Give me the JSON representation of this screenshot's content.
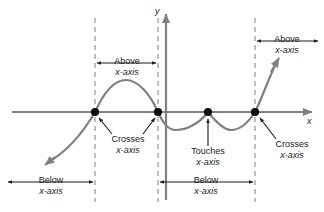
{
  "figure": {
    "colors": {
      "curve": "#808080",
      "axis": "#808080",
      "dashed": "#808080",
      "marker": "#111111",
      "text": "#1a1a1a",
      "annotation_arrow": "#1a1a1a",
      "background": "#ffffff"
    }
  },
  "axes": {
    "x_label": "x",
    "y_label": "y",
    "x_axis_y": 112,
    "y_axis_x": 166
  },
  "roots": [
    {
      "id": "root-1",
      "x": 95,
      "y": 112,
      "behavior": "crosses"
    },
    {
      "id": "root-2",
      "x": 158,
      "y": 112,
      "behavior": "crosses"
    },
    {
      "id": "root-3",
      "x": 208,
      "y": 112,
      "behavior": "touches"
    },
    {
      "id": "root-4",
      "x": 255,
      "y": 112,
      "behavior": "crosses"
    }
  ],
  "dashed_lines": [
    {
      "id": "dashed-line-1",
      "x": 95
    },
    {
      "id": "dashed-line-2",
      "x": 158
    },
    {
      "id": "dashed-line-3",
      "x": 255
    }
  ],
  "annotations": {
    "above_left": {
      "line1": "Above",
      "line2": "x-axis"
    },
    "above_right": {
      "line1": "Above",
      "line2": "x-axis"
    },
    "below_left": {
      "line1": "Below",
      "line2": "x-axis"
    },
    "below_right": {
      "line1": "Below",
      "line2": "x-axis"
    },
    "crosses_left": {
      "line1": "Crosses",
      "line2": "x-axis"
    },
    "crosses_right": {
      "line1": "Crosses",
      "line2": "x-axis"
    },
    "touches": {
      "line1": "Touches",
      "line2": "x-axis"
    }
  }
}
